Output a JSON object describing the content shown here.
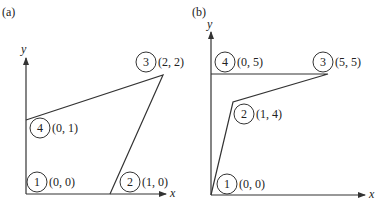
{
  "panels": [
    {
      "id": "a",
      "label": "(a)",
      "x_axis_label": "x",
      "y_axis_label": "y",
      "nodes": [
        {
          "num": "1",
          "coord": "(0, 0)"
        },
        {
          "num": "2",
          "coord": "(1, 0)"
        },
        {
          "num": "3",
          "coord": "(2, 2)"
        },
        {
          "num": "4",
          "coord": "(0, 1)"
        }
      ]
    },
    {
      "id": "b",
      "label": "(b)",
      "x_axis_label": "x",
      "y_axis_label": "y",
      "nodes": [
        {
          "num": "1",
          "coord": "(0, 0)"
        },
        {
          "num": "2",
          "coord": "(1, 4)"
        },
        {
          "num": "3",
          "coord": "(5, 5)"
        },
        {
          "num": "4",
          "coord": "(0, 5)"
        }
      ]
    }
  ]
}
